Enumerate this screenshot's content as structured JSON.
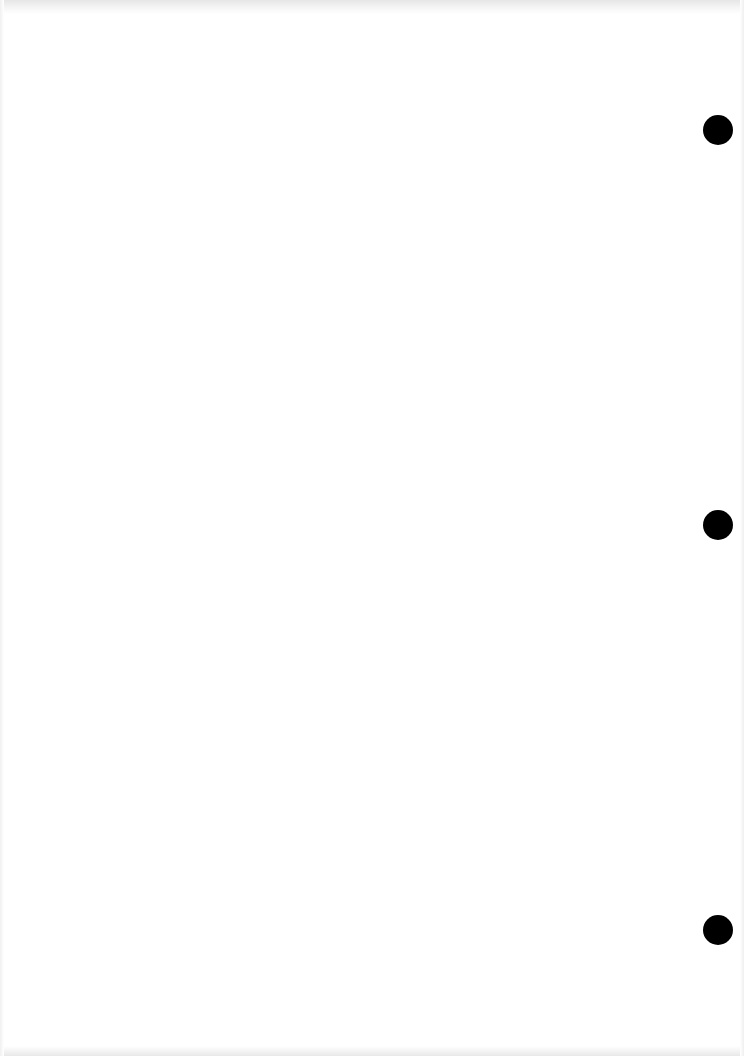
{
  "page": {
    "type": "blank-scanned-sheet",
    "background_color": "#ffffff",
    "text_content": "",
    "punch_holes": [
      {
        "cx": 718,
        "cy": 130,
        "r": 15,
        "color": "#000000"
      },
      {
        "cx": 718,
        "cy": 525,
        "r": 15,
        "color": "#000000"
      },
      {
        "cx": 718,
        "cy": 930,
        "r": 15,
        "color": "#000000"
      }
    ]
  }
}
